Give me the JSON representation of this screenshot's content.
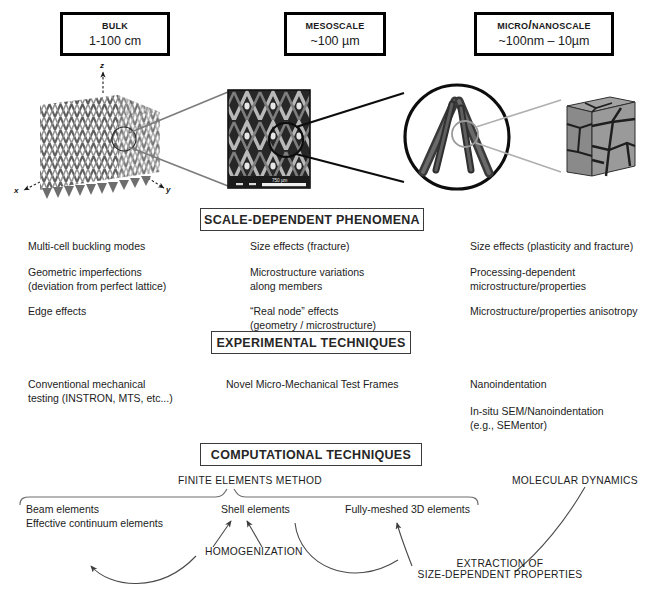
{
  "figure": {
    "top_partial_note": "",
    "scales": [
      {
        "name": "scale-bulk",
        "title": "Bulk",
        "range": "1-100 cm"
      },
      {
        "name": "scale-meso",
        "title": "Mesoscale",
        "range": "~100 µm"
      },
      {
        "name": "scale-micronano",
        "title": "Micro/Nanoscale",
        "range": "~100nm – 10µm"
      }
    ],
    "axes": {
      "x": "x",
      "y": "y",
      "z": "z"
    },
    "scale_bar_label": "750 µm",
    "sections": [
      {
        "name": "scale-dependent-phenomena",
        "label": "SCALE-DEPENDENT PHENOMENA"
      },
      {
        "name": "experimental-techniques",
        "label": "EXPERIMENTAL TECHNIQUES"
      },
      {
        "name": "computational-techniques",
        "label": "COMPUTATIONAL TECHNIQUES"
      }
    ],
    "phenomena": {
      "bulk": [
        "Multi-cell buckling modes",
        "Geometric imperfections\n(deviation from perfect lattice)",
        "Edge effects"
      ],
      "meso": [
        "Size effects (fracture)",
        "Microstructure variations\nalong members",
        "“Real node” effects\n(geometry / microstructure)"
      ],
      "micro": [
        "Size effects (plasticity and fracture)",
        "Processing-dependent\nmicrostructure/properties",
        "Microstructure/properties anisotropy"
      ]
    },
    "experimental": {
      "bulk": [
        "Conventional mechanical\ntesting (INSTRON, MTS, etc...)"
      ],
      "meso": [
        "Novel Micro-Mechanical Test Frames"
      ],
      "micro": [
        "Nanoindentation",
        "In-situ SEM/Nanoindentation\n(e.g., SEMentor)"
      ]
    },
    "computational": {
      "fem_label": "FINITE ELEMENTS METHOD",
      "md_label": "MOLECULAR DYNAMICS",
      "methods": [
        "Beam elements\nEffective continuum elements",
        "Shell elements",
        "Fully-meshed 3D elements"
      ],
      "homogenization_label": "HOMOGENIZATION",
      "extraction_label": "EXTRACTION OF\nSIZE-DEPENDENT PROPERTIES"
    },
    "colors": {
      "ink": "#1a1a1a",
      "box_border": "#3a3a3a",
      "connector": "#8a8a8a",
      "arrow": "#4a4a4a",
      "lattice_dark": "#4d4d4d",
      "lattice_mid": "#7d7d7d",
      "sem_bg": "#2b2b2b",
      "grain_fill": "#8e8e8e"
    }
  }
}
